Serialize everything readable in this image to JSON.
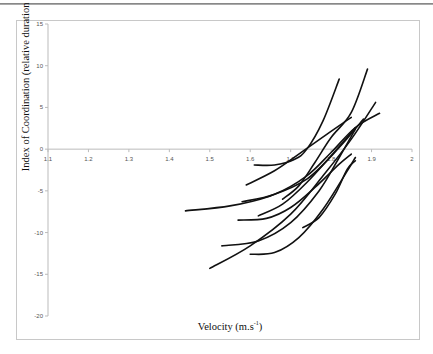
{
  "chart_data": {
    "type": "line",
    "title": "",
    "xlabel": "Velocity (m.s-1)",
    "xlabel_main": "Velocity (m.s",
    "xlabel_sup": "-1",
    "xlabel_close": ")",
    "ylabel": "Index of Coordination (relative duration in % of a complete stroke)",
    "xlim": [
      1.1,
      2.0
    ],
    "ylim": [
      -20,
      15
    ],
    "x_ticks": [
      "1.1",
      "1.2",
      "1.3",
      "1.4",
      "1.5",
      "1.6",
      "1.7",
      "1.8",
      "1.9",
      "2"
    ],
    "y_ticks": [
      "15",
      "10",
      "5",
      "0",
      "-5",
      "-10",
      "-15",
      "-20"
    ],
    "grid": false,
    "legend": null,
    "series": [
      {
        "name": "swimmer-1",
        "points": [
          [
            1.44,
            -7.4
          ],
          [
            1.55,
            -6.8
          ],
          [
            1.65,
            -5.6
          ],
          [
            1.74,
            -3.6
          ],
          [
            1.82,
            0.2
          ],
          [
            1.88,
            3.6
          ]
        ]
      },
      {
        "name": "swimmer-2",
        "points": [
          [
            1.5,
            -14.3
          ],
          [
            1.6,
            -11.6
          ],
          [
            1.7,
            -7.8
          ],
          [
            1.78,
            -3.2
          ],
          [
            1.85,
            1.2
          ],
          [
            1.91,
            5.6
          ]
        ]
      },
      {
        "name": "swimmer-3",
        "points": [
          [
            1.53,
            -11.6
          ],
          [
            1.62,
            -11.0
          ],
          [
            1.7,
            -8.8
          ],
          [
            1.77,
            -5.0
          ],
          [
            1.82,
            -1.0
          ],
          [
            1.86,
            2.4
          ]
        ]
      },
      {
        "name": "swimmer-4",
        "points": [
          [
            1.59,
            -4.3
          ],
          [
            1.66,
            -2.6
          ],
          [
            1.72,
            -0.6
          ],
          [
            1.79,
            1.8
          ],
          [
            1.85,
            3.8
          ]
        ]
      },
      {
        "name": "swimmer-5",
        "points": [
          [
            1.61,
            -1.9
          ],
          [
            1.66,
            -1.9
          ],
          [
            1.71,
            -1.2
          ],
          [
            1.74,
            0.0
          ],
          [
            1.78,
            3.4
          ],
          [
            1.82,
            8.4
          ]
        ]
      },
      {
        "name": "swimmer-6",
        "points": [
          [
            1.6,
            -12.6
          ],
          [
            1.66,
            -12.4
          ],
          [
            1.72,
            -10.6
          ],
          [
            1.78,
            -7.2
          ],
          [
            1.84,
            -2.6
          ],
          [
            1.86,
            -1.0
          ]
        ]
      },
      {
        "name": "swimmer-7",
        "points": [
          [
            1.57,
            -8.5
          ],
          [
            1.64,
            -8.3
          ],
          [
            1.7,
            -7.0
          ],
          [
            1.76,
            -4.6
          ],
          [
            1.82,
            -1.8
          ],
          [
            1.85,
            -0.6
          ]
        ]
      },
      {
        "name": "swimmer-8",
        "points": [
          [
            1.62,
            -8.0
          ],
          [
            1.68,
            -6.6
          ],
          [
            1.74,
            -4.0
          ],
          [
            1.8,
            -0.8
          ],
          [
            1.86,
            2.6
          ]
        ]
      },
      {
        "name": "swimmer-9",
        "points": [
          [
            1.68,
            -6.0
          ],
          [
            1.72,
            -4.4
          ],
          [
            1.76,
            -1.6
          ],
          [
            1.8,
            1.4
          ],
          [
            1.85,
            4.4
          ],
          [
            1.89,
            9.6
          ]
        ]
      },
      {
        "name": "swimmer-10",
        "points": [
          [
            1.58,
            -6.3
          ],
          [
            1.66,
            -5.4
          ],
          [
            1.74,
            -3.2
          ],
          [
            1.8,
            -0.4
          ],
          [
            1.86,
            2.6
          ],
          [
            1.92,
            4.3
          ]
        ]
      },
      {
        "name": "swimmer-11",
        "points": [
          [
            1.73,
            -9.4
          ],
          [
            1.77,
            -8.2
          ],
          [
            1.81,
            -5.4
          ],
          [
            1.84,
            -2.4
          ],
          [
            1.86,
            -1.4
          ]
        ]
      }
    ]
  }
}
